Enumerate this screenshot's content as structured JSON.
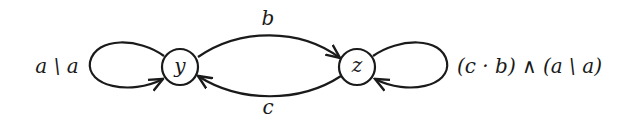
{
  "diagram": {
    "type": "state-automaton",
    "nodes": [
      {
        "id": "y",
        "label": "y"
      },
      {
        "id": "z",
        "label": "z"
      }
    ],
    "edges": [
      {
        "from": "y",
        "to": "y",
        "label_parts": [
          "a",
          "\\",
          "a"
        ],
        "label": "a \\ a"
      },
      {
        "from": "y",
        "to": "z",
        "label": "b"
      },
      {
        "from": "z",
        "to": "y",
        "label": "c"
      },
      {
        "from": "z",
        "to": "z",
        "label": "(c · b) ∧ (a \\ a)"
      }
    ]
  }
}
